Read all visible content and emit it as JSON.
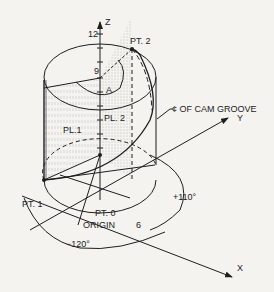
{
  "diagram": {
    "type": "isometric cylinder cam diagram",
    "axes": {
      "z": {
        "label": "Z",
        "ticks": [
          "12",
          "9"
        ]
      },
      "y": {
        "label": "Y"
      },
      "x": {
        "label": "X",
        "tick": "6"
      }
    },
    "points": {
      "pt0": "PT. 0",
      "pt1": "PT. 1",
      "pt2": "PT. 2",
      "a": "A"
    },
    "planes": {
      "pl1": "PL.1",
      "pl2": "PL. 2"
    },
    "annotations": {
      "cam_groove": "¢ OF CAM GROOVE",
      "origin": "ORIGIN",
      "angle_pos": "+110°",
      "angle_neg": "−120°"
    },
    "colors": {
      "line": "#1e1e1e",
      "background": "#f4f3f0",
      "stipple": "#777777"
    }
  }
}
